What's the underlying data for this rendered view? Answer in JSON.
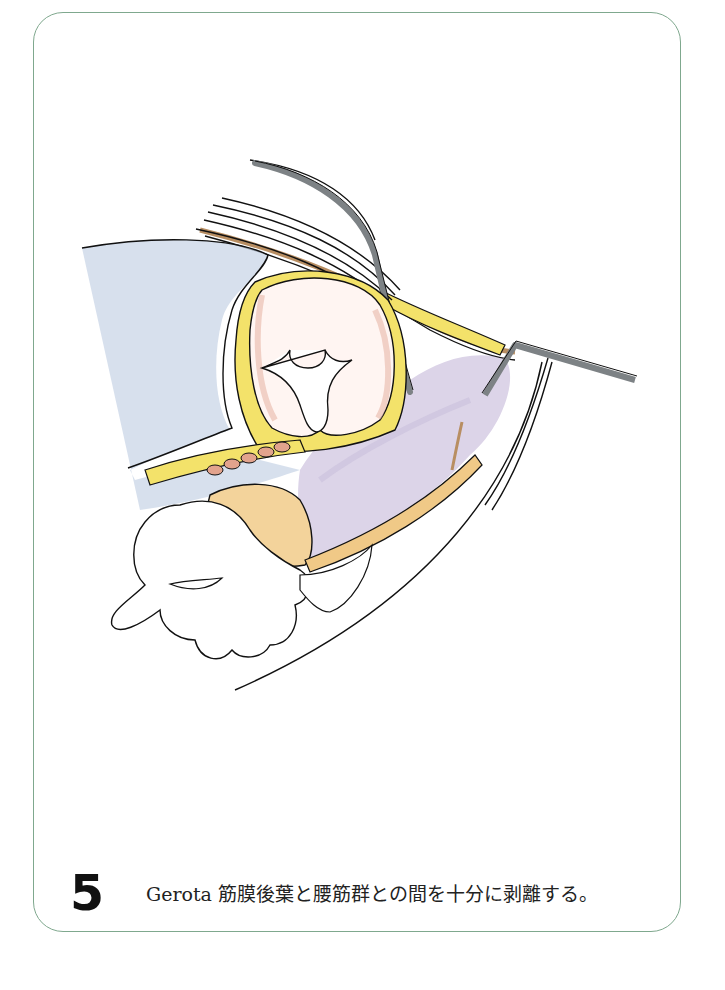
{
  "figure": {
    "step_number": "5",
    "caption": "Gerota 筋膜後葉と腰筋群との間を十分に剥離する。",
    "border_color": "#7fa88e"
  },
  "illustration": {
    "subject": "surgical-illustration-gerota-fascia-dissection",
    "colors": {
      "outline": "#111111",
      "retractor_gray": "#7d8285",
      "fascia_yellow": "#f3e26a",
      "kidney_pink": "#efc9bd",
      "psoas_lavender": "#d9d2e6",
      "fat_orange": "#f0c987",
      "vessel_blue": "#9fb3cf",
      "muscle_tan": "#c9a27a"
    }
  }
}
